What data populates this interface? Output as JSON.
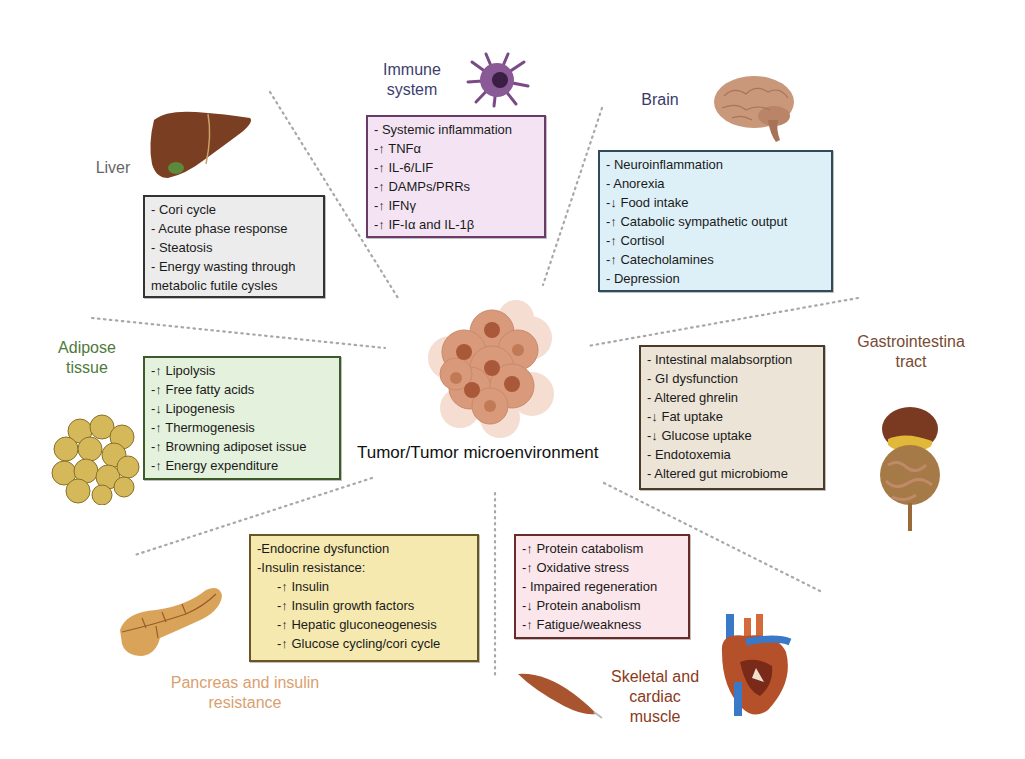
{
  "center": {
    "label": "Tumor/Tumor microenvironment"
  },
  "colors": {
    "immune": {
      "bg": "#f4e4f3",
      "border": "#6a3a6a",
      "label": "#3e3e6e"
    },
    "brain": {
      "bg": "#ddf0f8",
      "border": "#2f4a5a",
      "label": "#3a3a6a"
    },
    "liver": {
      "bg": "#ececec",
      "border": "#333333",
      "label": "#666666"
    },
    "adipose": {
      "bg": "#e4f1dc",
      "border": "#3c5a2a",
      "label": "#4e7a3a"
    },
    "gi": {
      "bg": "#ece4d6",
      "border": "#4a3a28",
      "label": "#7a4a32"
    },
    "pancreas": {
      "bg": "#f5e9b0",
      "border": "#6a5524",
      "label": "#d9a070"
    },
    "muscle": {
      "bg": "#fbe6ec",
      "border": "#6a2a28",
      "label": "#8a3a20"
    }
  },
  "immune": {
    "label_line1": "Immune",
    "label_line2": "system",
    "items": [
      "- Systemic inflammation",
      "-↑ TNFα",
      "-↑ IL-6/LIF",
      "-↑ DAMPs/PRRs",
      "-↑ IFNγ",
      "-↑ IF-Iα and IL-1β"
    ]
  },
  "brain": {
    "label": "Brain",
    "items": [
      "- Neuroinflammation",
      "- Anorexia",
      "-↓ Food intake",
      "-↑ Catabolic sympathetic output",
      "-↑ Cortisol",
      "-↑ Catecholamines",
      "- Depression"
    ]
  },
  "liver": {
    "label": "Liver",
    "items": [
      "- Cori cycle",
      "- Acute phase response",
      "- Steatosis",
      "- Energy wasting through",
      "metabolic futile cysles"
    ]
  },
  "adipose": {
    "label_line1": "Adipose",
    "label_line2": "tissue",
    "items": [
      "-↑ Lipolysis",
      "-↑ Free fatty acids",
      "-↓ Lipogenesis",
      "-↑ Thermogenesis",
      "-↑ Browning adiposet issue",
      "-↑ Energy expenditure"
    ]
  },
  "gi": {
    "label_line1": "Gastrointestina",
    "label_line2": "tract",
    "items": [
      "- Intestinal malabsorption",
      "- GI dysfunction",
      "- Altered ghrelin",
      "-↓ Fat uptake",
      "-↓ Glucose uptake",
      "- Endotoxemia",
      "- Altered gut microbiome"
    ]
  },
  "pancreas": {
    "label_line1": "Pancreas and insulin",
    "label_line2": "resistance",
    "items": [
      "-Endocrine dysfunction",
      "-Insulin resistance:"
    ],
    "subitems": [
      "-↑ Insulin",
      "-↑ Insulin growth factors",
      "-↑ Hepatic gluconeogenesis",
      "-↑ Glucose cycling/cori cycle"
    ]
  },
  "muscle": {
    "label_line1": "Skeletal and",
    "label_line2": "cardiac",
    "label_line3": "muscle",
    "items": [
      "-↑ Protein catabolism",
      "-↑ Oxidative stress",
      "- Impaired regeneration",
      "-↓ Protein anabolism",
      "-↑ Fatigue/weakness"
    ]
  }
}
